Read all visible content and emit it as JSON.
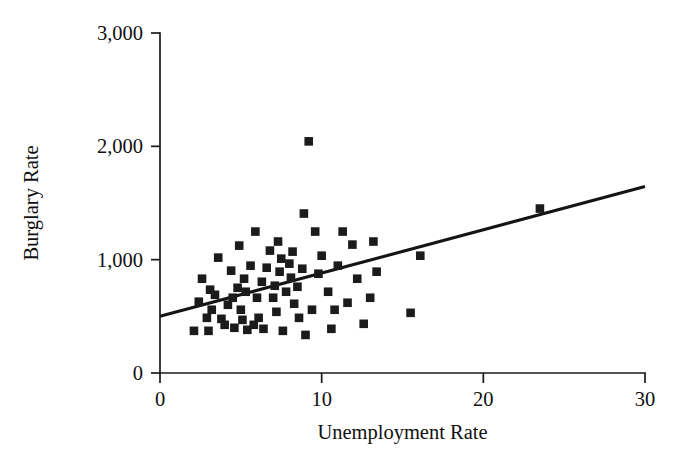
{
  "chart_data": {
    "type": "scatter",
    "title": "",
    "xlabel": "Unemployment Rate",
    "ylabel": "Burglary Rate",
    "xlim": [
      0,
      30
    ],
    "ylim": [
      0,
      3000
    ],
    "xticks": [
      0,
      10,
      20,
      30
    ],
    "yticks": [
      0,
      1000,
      2000,
      3000
    ],
    "xtick_labels": [
      "0",
      "10",
      "20",
      "30"
    ],
    "ytick_labels": [
      "0",
      "1,000",
      "2,000",
      "3,000"
    ],
    "grid": false,
    "legend": null,
    "marker": "square",
    "marker_color": "#1b1b1b",
    "line_color": "#141414",
    "axis_color": "#1a1a1a",
    "background_color": "#ffffff",
    "trendline": {
      "type": "linear",
      "x": [
        0,
        30
      ],
      "y": [
        500,
        1645
      ],
      "intercept": 500,
      "slope": 38.2
    },
    "points": [
      {
        "x": 2.1,
        "y": 372
      },
      {
        "x": 2.4,
        "y": 629
      },
      {
        "x": 2.6,
        "y": 832
      },
      {
        "x": 2.9,
        "y": 487
      },
      {
        "x": 3.0,
        "y": 372
      },
      {
        "x": 3.1,
        "y": 735
      },
      {
        "x": 3.2,
        "y": 558
      },
      {
        "x": 3.4,
        "y": 690
      },
      {
        "x": 3.6,
        "y": 1018
      },
      {
        "x": 3.8,
        "y": 478
      },
      {
        "x": 4.0,
        "y": 425
      },
      {
        "x": 4.2,
        "y": 602
      },
      {
        "x": 4.4,
        "y": 903
      },
      {
        "x": 4.5,
        "y": 664
      },
      {
        "x": 4.6,
        "y": 399
      },
      {
        "x": 4.8,
        "y": 752
      },
      {
        "x": 4.9,
        "y": 1124
      },
      {
        "x": 5.0,
        "y": 558
      },
      {
        "x": 5.1,
        "y": 469
      },
      {
        "x": 5.2,
        "y": 832
      },
      {
        "x": 5.3,
        "y": 717
      },
      {
        "x": 5.4,
        "y": 381
      },
      {
        "x": 5.6,
        "y": 947
      },
      {
        "x": 5.8,
        "y": 425
      },
      {
        "x": 5.9,
        "y": 1248
      },
      {
        "x": 6.0,
        "y": 664
      },
      {
        "x": 6.1,
        "y": 487
      },
      {
        "x": 6.3,
        "y": 805
      },
      {
        "x": 6.4,
        "y": 390
      },
      {
        "x": 6.6,
        "y": 929
      },
      {
        "x": 6.8,
        "y": 1080
      },
      {
        "x": 7.0,
        "y": 664
      },
      {
        "x": 7.1,
        "y": 770
      },
      {
        "x": 7.2,
        "y": 540
      },
      {
        "x": 7.3,
        "y": 1160
      },
      {
        "x": 7.4,
        "y": 894
      },
      {
        "x": 7.5,
        "y": 1009
      },
      {
        "x": 7.6,
        "y": 372
      },
      {
        "x": 7.8,
        "y": 717
      },
      {
        "x": 8.0,
        "y": 965
      },
      {
        "x": 8.1,
        "y": 841
      },
      {
        "x": 8.2,
        "y": 1071
      },
      {
        "x": 8.3,
        "y": 611
      },
      {
        "x": 8.5,
        "y": 761
      },
      {
        "x": 8.6,
        "y": 487
      },
      {
        "x": 8.8,
        "y": 920
      },
      {
        "x": 8.9,
        "y": 1407
      },
      {
        "x": 9.0,
        "y": 336
      },
      {
        "x": 9.2,
        "y": 2044
      },
      {
        "x": 9.4,
        "y": 558
      },
      {
        "x": 9.6,
        "y": 1248
      },
      {
        "x": 9.8,
        "y": 876
      },
      {
        "x": 10.0,
        "y": 1035
      },
      {
        "x": 10.4,
        "y": 717
      },
      {
        "x": 10.6,
        "y": 390
      },
      {
        "x": 10.8,
        "y": 558
      },
      {
        "x": 11.0,
        "y": 947
      },
      {
        "x": 11.3,
        "y": 1248
      },
      {
        "x": 11.6,
        "y": 620
      },
      {
        "x": 11.9,
        "y": 1133
      },
      {
        "x": 12.2,
        "y": 832
      },
      {
        "x": 12.6,
        "y": 434
      },
      {
        "x": 13.0,
        "y": 664
      },
      {
        "x": 13.2,
        "y": 1160
      },
      {
        "x": 13.4,
        "y": 894
      },
      {
        "x": 15.5,
        "y": 531
      },
      {
        "x": 16.1,
        "y": 1035
      },
      {
        "x": 23.5,
        "y": 1451
      }
    ]
  },
  "geometry": {
    "plot_left_px": 160,
    "plot_right_px": 645,
    "plot_bottom_px": 373,
    "plot_top_px": 33
  }
}
